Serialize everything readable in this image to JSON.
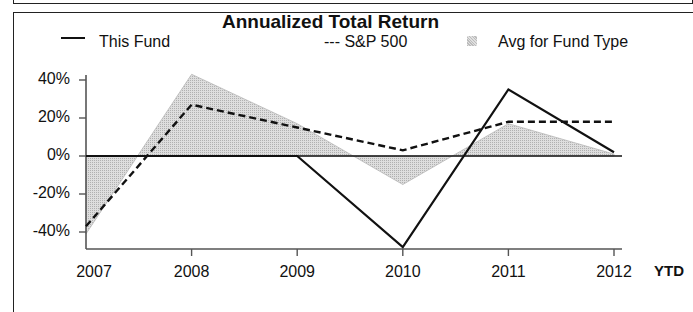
{
  "chart_data": {
    "type": "line",
    "title": "Annualized Total Return",
    "xlabel": "",
    "ylabel": "",
    "categories": [
      "2007",
      "2008",
      "2009",
      "2010",
      "2011",
      "2012"
    ],
    "x_suffix_label": "YTD",
    "yticks": [
      "40%",
      "20%",
      "0%",
      "-20%",
      "-40%"
    ],
    "ytick_values": [
      40,
      20,
      0,
      -20,
      -40
    ],
    "ylim": [
      -50,
      45
    ],
    "grid": false,
    "legend_position": "top",
    "series": [
      {
        "name": "This Fund",
        "style": "solid",
        "values": [
          0,
          0,
          0,
          -48,
          35,
          2
        ]
      },
      {
        "name": "S&P 500",
        "style": "dashed",
        "values": [
          -37,
          27,
          15,
          3,
          18,
          18
        ]
      },
      {
        "name": "Avg for Fund Type",
        "style": "area",
        "values": [
          -41,
          43,
          17,
          -15,
          17,
          1
        ]
      }
    ]
  },
  "legend": {
    "this_fund": "This Fund",
    "sp500": "--- S&P 500",
    "avg": "Avg for Fund Type"
  },
  "colors": {
    "line": "#111111",
    "area_fill": "#d0d0d0",
    "area_stroke": "#b8b8b8",
    "axis": "#555555"
  }
}
